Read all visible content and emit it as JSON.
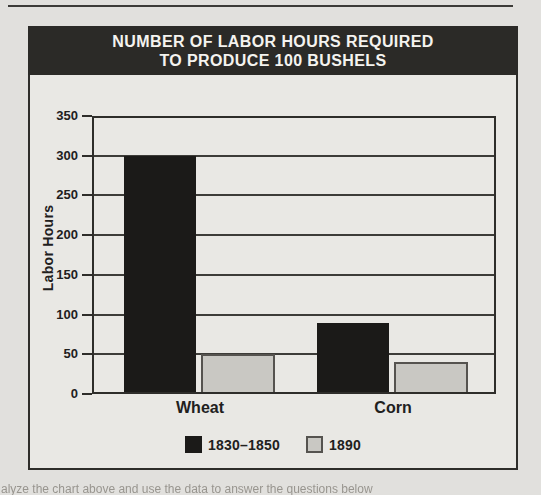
{
  "page": {
    "caption_fragment": "alyze the chart above and use the data to answer the questions below"
  },
  "colors": {
    "dark_series": "#1b1a18",
    "light_series": "#c9c8c3",
    "light_series_border": "#55534f",
    "title_bar_bg": "#2b2a27",
    "title_text": "#f4f3ef",
    "axis_line": "#2e2d2a"
  },
  "chart_data": {
    "type": "bar",
    "title": "NUMBER OF LABOR HOURS REQUIRED TO PRODUCE 100 BUSHELS",
    "title_lines": [
      "NUMBER OF LABOR HOURS REQUIRED",
      "TO PRODUCE 100 BUSHELS"
    ],
    "categories": [
      "Wheat",
      "Corn"
    ],
    "series": [
      {
        "name": "1830–1850",
        "color": "#1b1a18",
        "border": "#1b1a18",
        "values": [
          300,
          90
        ]
      },
      {
        "name": "1890",
        "color": "#c9c8c3",
        "border": "#55534f",
        "values": [
          50,
          40
        ]
      }
    ],
    "xlabel": "",
    "ylabel": "Labor Hours",
    "ylim": [
      0,
      350
    ],
    "yticks": [
      0,
      50,
      100,
      150,
      200,
      250,
      300,
      350
    ],
    "grid": true,
    "legend_position": "bottom"
  }
}
